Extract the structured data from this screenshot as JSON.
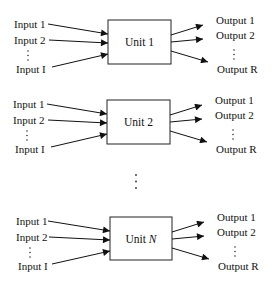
{
  "diagram": {
    "units": [
      {
        "name": "Unit 1",
        "name_prefix": "Unit",
        "name_index": "1",
        "index_italic": false,
        "inputs": [
          "Input 1",
          "Input 2",
          "Input I"
        ],
        "outputs": [
          "Output 1",
          "Output 2",
          "Output R"
        ]
      },
      {
        "name": "Unit 2",
        "name_prefix": "Unit",
        "name_index": "2",
        "index_italic": false,
        "inputs": [
          "Input 1",
          "Input 2",
          "Input I"
        ],
        "outputs": [
          "Output 1",
          "Output 2",
          "Output R"
        ]
      },
      {
        "name": "Unit N",
        "name_prefix": "Unit",
        "name_index": "N",
        "index_italic": true,
        "inputs": [
          "Input 1",
          "Input 2",
          "Input I"
        ],
        "outputs": [
          "Output 1",
          "Output 2",
          "Output R"
        ]
      }
    ],
    "ellipsis_between_units": "vertical-dots",
    "ellipsis_between_ports": "vertical-dots"
  }
}
